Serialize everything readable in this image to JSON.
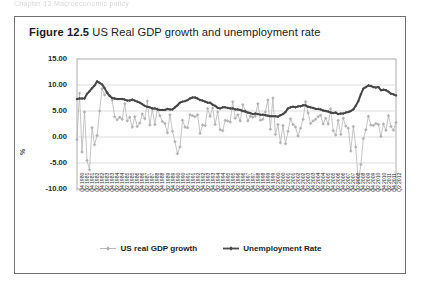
{
  "page": {
    "bleed_text": "Chapter 12  Macroeconomic policy"
  },
  "figure": {
    "number": "Figure 12.5",
    "title": "US Real GDP growth and unemployment rate"
  },
  "legend": {
    "position": "bottom",
    "items": [
      {
        "label": "US real GDP growth",
        "color": "#b0b0b0",
        "marker": "diamond"
      },
      {
        "label": "Unemployment Rate",
        "color": "#4a4a4a",
        "marker": "diamond"
      }
    ]
  },
  "colors": {
    "gdp": "#b2b2b2",
    "unemployment": "#474747",
    "grid": "#d0d0d0",
    "axis": "#8a8a8a",
    "border": "#6f6f74"
  },
  "chart_data": {
    "type": "line",
    "title": "US Real GDP growth and unemployment rate",
    "xlabel": "",
    "ylabel": "%",
    "ylim": [
      -10.0,
      15.0
    ],
    "ytick_labels": [
      "15.00",
      "10.00",
      "5.00",
      "0.00",
      "-5.00",
      "-10.00"
    ],
    "ytick_values": [
      15.0,
      10.0,
      5.0,
      0.0,
      -5.0,
      -10.0
    ],
    "grid": true,
    "x_tick_every": 2,
    "x": [
      "Q4 1980",
      "Q1 1981",
      "Q2 1981",
      "Q3 1981",
      "Q4 1981",
      "Q1 1982",
      "Q2 1982",
      "Q3 1982",
      "Q4 1982",
      "Q1 1983",
      "Q2 1983",
      "Q3 1983",
      "Q4 1983",
      "Q1 1984",
      "Q2 1984",
      "Q3 1984",
      "Q4 1984",
      "Q1 1985",
      "Q2 1985",
      "Q3 1985",
      "Q4 1985",
      "Q1 1986",
      "Q2 1986",
      "Q3 1986",
      "Q4 1986",
      "Q1 1987",
      "Q2 1987",
      "Q3 1987",
      "Q4 1987",
      "Q1 1988",
      "Q2 1988",
      "Q3 1988",
      "Q4 1988",
      "Q1 1989",
      "Q2 1989",
      "Q3 1989",
      "Q4 1989",
      "Q1 1990",
      "Q2 1990",
      "Q3 1990",
      "Q4 1990",
      "Q1 1991",
      "Q2 1991",
      "Q3 1991",
      "Q4 1991",
      "Q1 1992",
      "Q2 1992",
      "Q3 1992",
      "Q4 1992",
      "Q1 1993",
      "Q2 1993",
      "Q3 1993",
      "Q4 1993",
      "Q1 1994",
      "Q2 1994",
      "Q3 1994",
      "Q4 1994",
      "Q1 1995",
      "Q2 1995",
      "Q3 1995",
      "Q4 1995",
      "Q1 1996",
      "Q2 1996",
      "Q3 1996",
      "Q4 1996",
      "Q1 1997",
      "Q2 1997",
      "Q3 1997",
      "Q4 1997",
      "Q1 1998",
      "Q2 1998",
      "Q3 1998",
      "Q4 1998",
      "Q1 1999",
      "Q2 1999",
      "Q3 1999",
      "Q4 1999",
      "Q1 2000",
      "Q2 2000",
      "Q3 2000",
      "Q4 2000",
      "Q1 2001",
      "Q2 2001",
      "Q3 2001",
      "Q4 2001",
      "Q1 2002",
      "Q2 2002",
      "Q3 2002",
      "Q4 2002",
      "Q1 2003",
      "Q2 2003",
      "Q3 2003",
      "Q4 2003",
      "Q1 2004",
      "Q2 2004",
      "Q3 2004",
      "Q4 2004",
      "Q1 2005",
      "Q2 2005",
      "Q3 2005",
      "Q4 2005",
      "Q1 2006",
      "Q2 2006",
      "Q3 2006",
      "Q4 2006",
      "Q1 2007",
      "Q2 2007",
      "Q3 2007",
      "Q4 2007",
      "Q1 2008",
      "Q2 2008",
      "Q3 2008",
      "Q4 2008",
      "Q1 2009",
      "Q2 2009",
      "Q3 2009",
      "Q4 2009",
      "Q1 2010",
      "Q2 2010",
      "Q3 2010",
      "Q4 2010",
      "Q1 2011",
      "Q2 2011",
      "Q3 2011",
      "Q4 2011",
      "Q1 2012",
      "Q2 2012",
      "Q3 2012"
    ],
    "x_tick_labels": [
      "Q4 1980",
      "Q2 1981",
      "Q4 1981",
      "Q2 1982",
      "Q4 1982",
      "Q2 1983",
      "Q4 1983",
      "Q2 1984",
      "Q4 1984",
      "Q2 1985",
      "Q4 1985",
      "Q2 1986",
      "Q4 1986",
      "Q2 1987",
      "Q4 1987",
      "Q2 1988",
      "Q4 1988",
      "Q2 1989",
      "Q4 1989",
      "Q2 1990",
      "Q4 1990",
      "Q2 1991",
      "Q4 1991",
      "Q2 1992",
      "Q4 1992",
      "Q2 1993",
      "Q4 1993",
      "Q2 1994",
      "Q4 1994",
      "Q2 1995",
      "Q4 1995",
      "Q2 1996",
      "Q4 1996",
      "Q2 1997",
      "Q4 1997",
      "Q2 1998",
      "Q4 1998",
      "Q2 1999",
      "Q4 1999",
      "Q2 2000",
      "Q4 2000",
      "Q2 2001",
      "Q4 2001",
      "Q2 2002",
      "Q4 2002",
      "Q2 2003",
      "Q4 2003",
      "Q2 2004",
      "Q4 2004",
      "Q2 2005",
      "Q4 2005",
      "Q2 2006",
      "Q4 2006",
      "Q2 2007",
      "Q4 2007",
      "Q2 2008",
      "Q4 2008",
      "Q2 2009",
      "Q4 2009",
      "Q2 2010",
      "Q4 2010",
      "Q2 2011",
      "Q4 2011",
      "Q2 2012"
    ],
    "series": [
      {
        "name": "US real GDP growth",
        "color": "#b2b2b2",
        "marker": "diamond",
        "values": [
          -0.5,
          8.4,
          -2.9,
          4.8,
          -4.5,
          -6.3,
          1.8,
          -1.5,
          0.3,
          5.0,
          9.3,
          8.1,
          8.5,
          8.0,
          7.1,
          3.9,
          3.3,
          3.8,
          3.4,
          6.4,
          3.1,
          3.8,
          1.9,
          3.9,
          2.0,
          2.7,
          4.4,
          3.5,
          6.9,
          2.3,
          5.4,
          2.4,
          5.4,
          4.1,
          3.0,
          2.6,
          0.8,
          4.3,
          1.1,
          -0.9,
          -3.2,
          -1.9,
          3.2,
          1.9,
          1.8,
          4.3,
          4.1,
          3.9,
          4.3,
          0.7,
          2.3,
          2.2,
          5.5,
          4.0,
          5.6,
          2.4,
          4.8,
          1.4,
          1.2,
          3.2,
          3.1,
          2.9,
          6.8,
          3.6,
          4.3,
          3.1,
          6.2,
          5.1,
          3.1,
          4.0,
          3.8,
          4.0,
          6.4,
          3.2,
          3.4,
          4.8,
          7.1,
          1.5,
          7.5,
          0.5,
          2.4,
          -1.1,
          2.2,
          -1.3,
          1.1,
          3.5,
          2.4,
          1.9,
          0.2,
          1.7,
          3.4,
          6.8,
          4.6,
          2.6,
          3.1,
          3.4,
          3.9,
          4.2,
          2.5,
          3.6,
          2.5,
          5.4,
          1.2,
          0.4,
          3.2,
          0.5,
          3.6,
          2.1,
          1.7,
          -2.7,
          2.0,
          -1.9,
          -8.9,
          -5.3,
          -0.3,
          1.4,
          4.0,
          2.3,
          2.2,
          2.6,
          2.4,
          0.1,
          2.5,
          1.3,
          4.1,
          2.0,
          1.3,
          2.8
        ]
      },
      {
        "name": "Unemployment Rate",
        "color": "#474747",
        "marker": "diamond",
        "values": [
          7.3,
          7.4,
          7.4,
          7.4,
          8.3,
          8.8,
          9.4,
          9.9,
          10.7,
          10.4,
          10.1,
          9.4,
          8.5,
          7.9,
          7.5,
          7.4,
          7.3,
          7.3,
          7.3,
          7.2,
          7.0,
          7.0,
          7.2,
          7.0,
          6.8,
          6.6,
          6.3,
          6.0,
          5.8,
          5.7,
          5.5,
          5.5,
          5.3,
          5.2,
          5.2,
          5.2,
          5.4,
          5.3,
          5.3,
          5.7,
          6.1,
          6.6,
          6.8,
          6.9,
          7.1,
          7.4,
          7.6,
          7.6,
          7.4,
          7.1,
          7.0,
          6.8,
          6.6,
          6.6,
          6.2,
          6.0,
          5.6,
          5.5,
          5.7,
          5.7,
          5.6,
          5.5,
          5.5,
          5.3,
          5.3,
          5.2,
          5.0,
          4.9,
          4.7,
          4.6,
          4.4,
          4.5,
          4.4,
          4.3,
          4.3,
          4.2,
          4.1,
          4.0,
          4.0,
          4.0,
          3.9,
          4.2,
          4.4,
          4.8,
          5.5,
          5.7,
          5.8,
          5.7,
          5.9,
          5.9,
          6.1,
          6.1,
          5.8,
          5.7,
          5.6,
          5.4,
          5.4,
          5.3,
          5.1,
          5.0,
          4.9,
          4.7,
          4.6,
          4.7,
          4.4,
          4.5,
          4.5,
          4.7,
          4.8,
          5.0,
          5.3,
          6.0,
          6.9,
          8.2,
          9.3,
          9.6,
          9.9,
          9.8,
          9.6,
          9.5,
          9.6,
          9.0,
          9.1,
          9.0,
          8.7,
          8.3,
          8.2,
          8.0
        ]
      }
    ]
  }
}
